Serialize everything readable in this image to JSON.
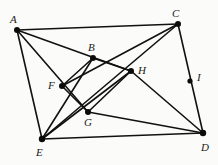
{
  "diagram": {
    "canvas": {
      "width": 218,
      "height": 165
    },
    "style": {
      "background_color": "#fbfbf9",
      "line_color": "#111111",
      "vertex_color": "#0b0b0b",
      "label_color": "#1a1a1a"
    },
    "points": [
      {
        "id": "A",
        "label": "A",
        "x": 17,
        "y": 30,
        "dot_radius": 3.0,
        "label_x": 10,
        "label_y": 14
      },
      {
        "id": "B",
        "label": "B",
        "x": 93,
        "y": 58,
        "dot_radius": 3.0,
        "label_x": 88,
        "label_y": 42
      },
      {
        "id": "C",
        "label": "C",
        "x": 178,
        "y": 24,
        "dot_radius": 3.0,
        "label_x": 172,
        "label_y": 8
      },
      {
        "id": "D",
        "label": "D",
        "x": 203,
        "y": 133,
        "dot_radius": 3.2,
        "label_x": 201,
        "label_y": 142
      },
      {
        "id": "E",
        "label": "E",
        "x": 42,
        "y": 139,
        "dot_radius": 3.2,
        "label_x": 36,
        "label_y": 147
      },
      {
        "id": "F",
        "label": "F",
        "x": 62,
        "y": 86,
        "dot_radius": 3.0,
        "label_x": 48,
        "label_y": 80
      },
      {
        "id": "G",
        "label": "G",
        "x": 88,
        "y": 112,
        "dot_radius": 3.0,
        "label_x": 84,
        "label_y": 117
      },
      {
        "id": "H",
        "label": "H",
        "x": 131,
        "y": 71,
        "dot_radius": 3.0,
        "label_x": 138,
        "label_y": 65
      },
      {
        "id": "I",
        "label": "I",
        "x": 190,
        "y": 81,
        "dot_radius": 2.6,
        "label_x": 197,
        "label_y": 72
      }
    ],
    "edges": [
      {
        "id": "edge-A-C",
        "from": "A",
        "to": "C"
      },
      {
        "id": "edge-A-E",
        "from": "A",
        "to": "E"
      },
      {
        "id": "edge-C-D",
        "from": "C",
        "to": "D"
      },
      {
        "id": "edge-E-D",
        "from": "E",
        "to": "D"
      },
      {
        "id": "edge-A-H",
        "from": "A",
        "to": "H"
      },
      {
        "id": "edge-A-G",
        "from": "A",
        "to": "G"
      },
      {
        "id": "edge-C-F",
        "from": "C",
        "to": "F"
      },
      {
        "id": "edge-C-E",
        "from": "C",
        "to": "E"
      },
      {
        "id": "edge-E-B",
        "from": "E",
        "to": "B"
      },
      {
        "id": "edge-D-H",
        "from": "D",
        "to": "H"
      },
      {
        "id": "edge-D-G",
        "from": "D",
        "to": "G"
      },
      {
        "id": "edge-E-H",
        "from": "E",
        "to": "H"
      },
      {
        "id": "edge-B-F",
        "from": "B",
        "to": "F"
      },
      {
        "id": "edge-F-G",
        "from": "F",
        "to": "G"
      },
      {
        "id": "edge-G-H",
        "from": "G",
        "to": "H"
      },
      {
        "id": "edge-B-H",
        "from": "B",
        "to": "H"
      }
    ]
  }
}
